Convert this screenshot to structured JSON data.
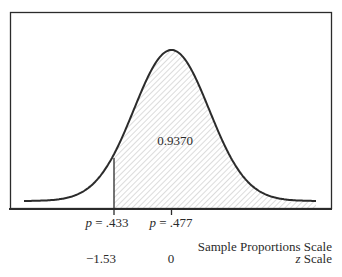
{
  "chart_data": {
    "type": "area",
    "title": "",
    "distribution": "normal",
    "mean_p": 0.477,
    "shaded_region": {
      "from_z": -1.53,
      "to_z": "inf",
      "area": 0.937
    },
    "area_label": "0.9370",
    "x_axes": [
      {
        "name": "Sample Proportions Scale",
        "ticks": [
          {
            "value": 0.433,
            "label_var": "p",
            "label_eq": " = ",
            "label_val": ".433"
          },
          {
            "value": 0.477,
            "label_var": "p",
            "label_eq": " = ",
            "label_val": ".477"
          }
        ]
      },
      {
        "name": "z Scale",
        "ticks": [
          {
            "value": -1.53,
            "label": "−1.53"
          },
          {
            "value": 0,
            "label": "0"
          }
        ]
      }
    ],
    "grid": false,
    "legend": null
  },
  "labels": {
    "area": "0.9370",
    "p1_var": "p",
    "p1_rest": " = .433",
    "p2_var": "p",
    "p2_rest": " = .477",
    "prop_scale": "Sample Proportions Scale",
    "z1": "−1.53",
    "z2": "0",
    "z_scale_var": "z",
    "z_scale_rest": " Scale"
  },
  "colors": {
    "curve": "#2b2b2b",
    "hatch": "#c8c8c8",
    "frame": "#2b2b2b"
  }
}
